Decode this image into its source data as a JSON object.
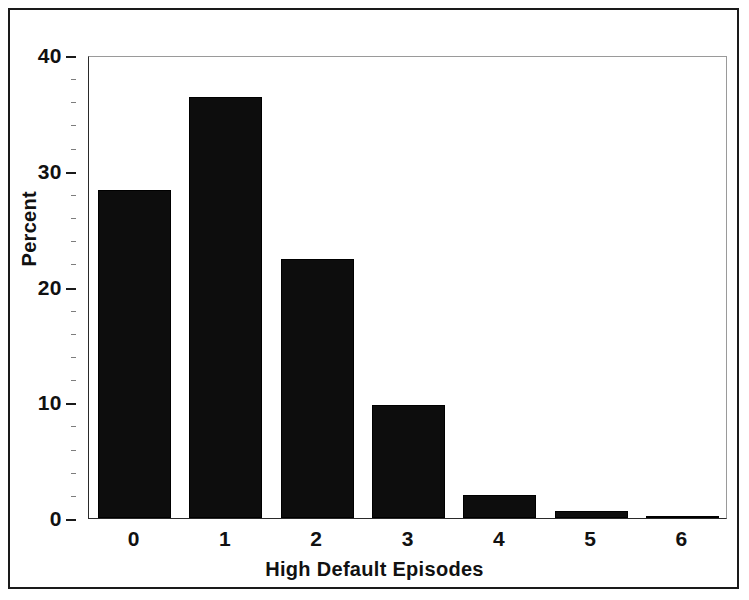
{
  "chart_data": {
    "type": "bar",
    "title": "",
    "xlabel": "High Default Episodes",
    "ylabel": "Percent",
    "categories": [
      "0",
      "1",
      "2",
      "3",
      "4",
      "5",
      "6"
    ],
    "values": [
      28.3,
      36.4,
      22.4,
      9.8,
      2.0,
      0.6,
      0.15
    ],
    "ylim": [
      0,
      40
    ],
    "ytick_labels": [
      "0",
      "10",
      "20",
      "30",
      "40"
    ],
    "ytick_values": [
      0,
      10,
      20,
      30,
      40
    ],
    "yminor_step": 2,
    "grid": false,
    "legend": false,
    "bar_color": "#0d0d0d",
    "frame_color": "#1a1a1a",
    "background": "#ffffff"
  },
  "axes": {
    "y_title": "Percent",
    "x_title": "High Default Episodes"
  }
}
